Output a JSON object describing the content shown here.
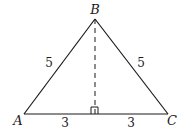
{
  "diagram": {
    "type": "isosceles-triangle-with-altitude",
    "vertices": [
      {
        "name": "A",
        "x": 24,
        "y": 114,
        "label_x": 18,
        "label_y": 125
      },
      {
        "name": "B",
        "x": 95,
        "y": 19,
        "label_x": 95,
        "label_y": 14
      },
      {
        "name": "C",
        "x": 168,
        "y": 114,
        "label_x": 172,
        "label_y": 125
      }
    ],
    "altitude": {
      "from": "B",
      "foot_x": 95,
      "foot_y": 114,
      "style": "dashed"
    },
    "right_angle_marker": true,
    "side_labels": [
      {
        "id": "AB",
        "text": "5",
        "x": 49,
        "y": 67
      },
      {
        "id": "BC",
        "text": "5",
        "x": 141,
        "y": 67
      },
      {
        "id": "A-foot",
        "text": "3",
        "x": 65,
        "y": 127
      },
      {
        "id": "foot-C",
        "text": "3",
        "x": 131,
        "y": 127
      }
    ],
    "line_color": "#1a1a1a"
  }
}
